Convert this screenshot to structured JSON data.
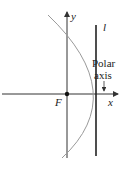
{
  "diagram": {
    "type": "parabola-polar-setup",
    "labels": {
      "y_axis": "y",
      "x_axis": "x",
      "focus": "F",
      "directrix": "l",
      "polar_axis_line1": "Polar",
      "polar_axis_line2": "axis"
    },
    "colors": {
      "axes": "#333333",
      "parabola": "#9a9a9a",
      "directrix": "#222222",
      "focus_dot": "#111111"
    }
  }
}
